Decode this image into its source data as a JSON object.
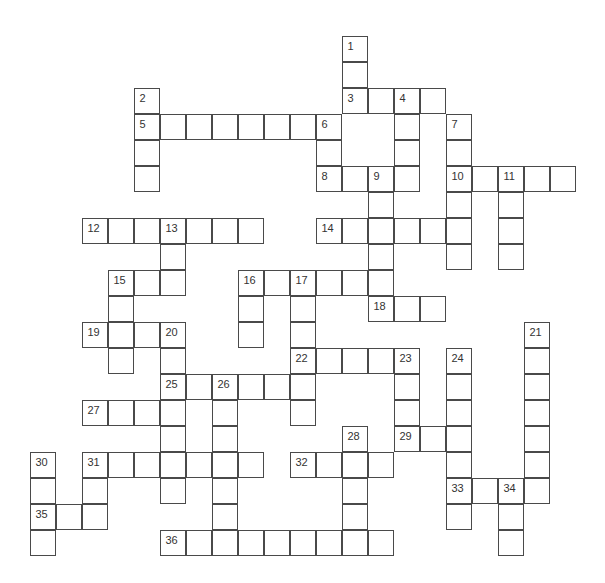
{
  "puzzle": {
    "type": "crossword",
    "origin": {
      "x": 30,
      "y": 36
    },
    "cell_size": 26,
    "colors": {
      "line": "#4a4a4a",
      "number": "#333333",
      "background": "#ffffff"
    },
    "across": [
      {
        "number": 3,
        "row": 2,
        "col": 12,
        "length": 4
      },
      {
        "number": 5,
        "row": 3,
        "col": 4,
        "length": 8
      },
      {
        "number": 8,
        "row": 5,
        "col": 11,
        "length": 4
      },
      {
        "number": 10,
        "row": 5,
        "col": 16,
        "length": 5
      },
      {
        "number": 12,
        "row": 7,
        "col": 2,
        "length": 7
      },
      {
        "number": 14,
        "row": 7,
        "col": 11,
        "length": 6
      },
      {
        "number": 15,
        "row": 9,
        "col": 3,
        "length": 3
      },
      {
        "number": 16,
        "row": 9,
        "col": 8,
        "length": 6
      },
      {
        "number": 18,
        "row": 10,
        "col": 13,
        "length": 3
      },
      {
        "number": 19,
        "row": 11,
        "col": 2,
        "length": 4
      },
      {
        "number": 22,
        "row": 12,
        "col": 10,
        "length": 5
      },
      {
        "number": 25,
        "row": 13,
        "col": 5,
        "length": 6
      },
      {
        "number": 27,
        "row": 14,
        "col": 2,
        "length": 4
      },
      {
        "number": 29,
        "row": 15,
        "col": 14,
        "length": 3
      },
      {
        "number": 31,
        "row": 16,
        "col": 2,
        "length": 7
      },
      {
        "number": 32,
        "row": 16,
        "col": 10,
        "length": 4
      },
      {
        "number": 33,
        "row": 17,
        "col": 16,
        "length": 4
      },
      {
        "number": 35,
        "row": 18,
        "col": 0,
        "length": 3
      },
      {
        "number": 36,
        "row": 19,
        "col": 5,
        "length": 9
      }
    ],
    "down": [
      {
        "number": 1,
        "row": 0,
        "col": 12,
        "length": 3
      },
      {
        "number": 2,
        "row": 2,
        "col": 4,
        "length": 4
      },
      {
        "number": 4,
        "row": 2,
        "col": 14,
        "length": 4
      },
      {
        "number": 6,
        "row": 3,
        "col": 11,
        "length": 3
      },
      {
        "number": 7,
        "row": 3,
        "col": 16,
        "length": 6
      },
      {
        "number": 9,
        "row": 5,
        "col": 13,
        "length": 6
      },
      {
        "number": 11,
        "row": 5,
        "col": 18,
        "length": 4
      },
      {
        "number": 13,
        "row": 7,
        "col": 5,
        "length": 3
      },
      {
        "number": 15,
        "row": 9,
        "col": 3,
        "length": 4
      },
      {
        "number": 16,
        "row": 9,
        "col": 8,
        "length": 3
      },
      {
        "number": 17,
        "row": 9,
        "col": 10,
        "length": 6
      },
      {
        "number": 20,
        "row": 11,
        "col": 5,
        "length": 7
      },
      {
        "number": 21,
        "row": 11,
        "col": 19,
        "length": 7
      },
      {
        "number": 23,
        "row": 12,
        "col": 14,
        "length": 4
      },
      {
        "number": 24,
        "row": 12,
        "col": 16,
        "length": 7
      },
      {
        "number": 26,
        "row": 13,
        "col": 7,
        "length": 7
      },
      {
        "number": 28,
        "row": 15,
        "col": 12,
        "length": 5
      },
      {
        "number": 30,
        "row": 16,
        "col": 0,
        "length": 4
      },
      {
        "number": 31,
        "row": 16,
        "col": 2,
        "length": 3
      },
      {
        "number": 34,
        "row": 17,
        "col": 18,
        "length": 3
      }
    ]
  }
}
